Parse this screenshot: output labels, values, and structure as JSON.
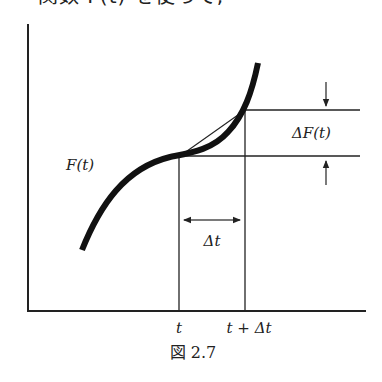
{
  "top_text": "関数 F(t) を使って,",
  "figure": {
    "curve_label": "F(t)",
    "delta_f_label": "ΔF(t)",
    "delta_t_label": "Δt",
    "x_tick_t": "t",
    "x_tick_t_plus_dt": "t + Δt",
    "caption": "図 2.7"
  },
  "colors": {
    "curve": "#111111",
    "lines": "#222222",
    "background": "#ffffff"
  }
}
